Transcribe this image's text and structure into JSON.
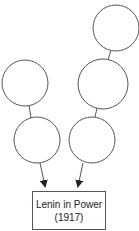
{
  "diagram": {
    "top_text_cut": "",
    "nodes": [
      {
        "id": "left-top",
        "cx": 25,
        "cy": 83,
        "r": 23,
        "label": ""
      },
      {
        "id": "left-bottom",
        "cx": 37,
        "cy": 140,
        "r": 23,
        "label": ""
      },
      {
        "id": "right-top",
        "cx": 116,
        "cy": 28,
        "r": 23,
        "label": ""
      },
      {
        "id": "right-middle",
        "cx": 103,
        "cy": 84,
        "r": 25,
        "label": ""
      },
      {
        "id": "right-bottom",
        "cx": 92,
        "cy": 140,
        "r": 23,
        "label": ""
      }
    ],
    "target": {
      "line1": "Lenin in Power",
      "line2": "(1917)"
    },
    "colors": {
      "stroke": "#555555",
      "background": "#ffffff",
      "text": "#222222"
    }
  }
}
